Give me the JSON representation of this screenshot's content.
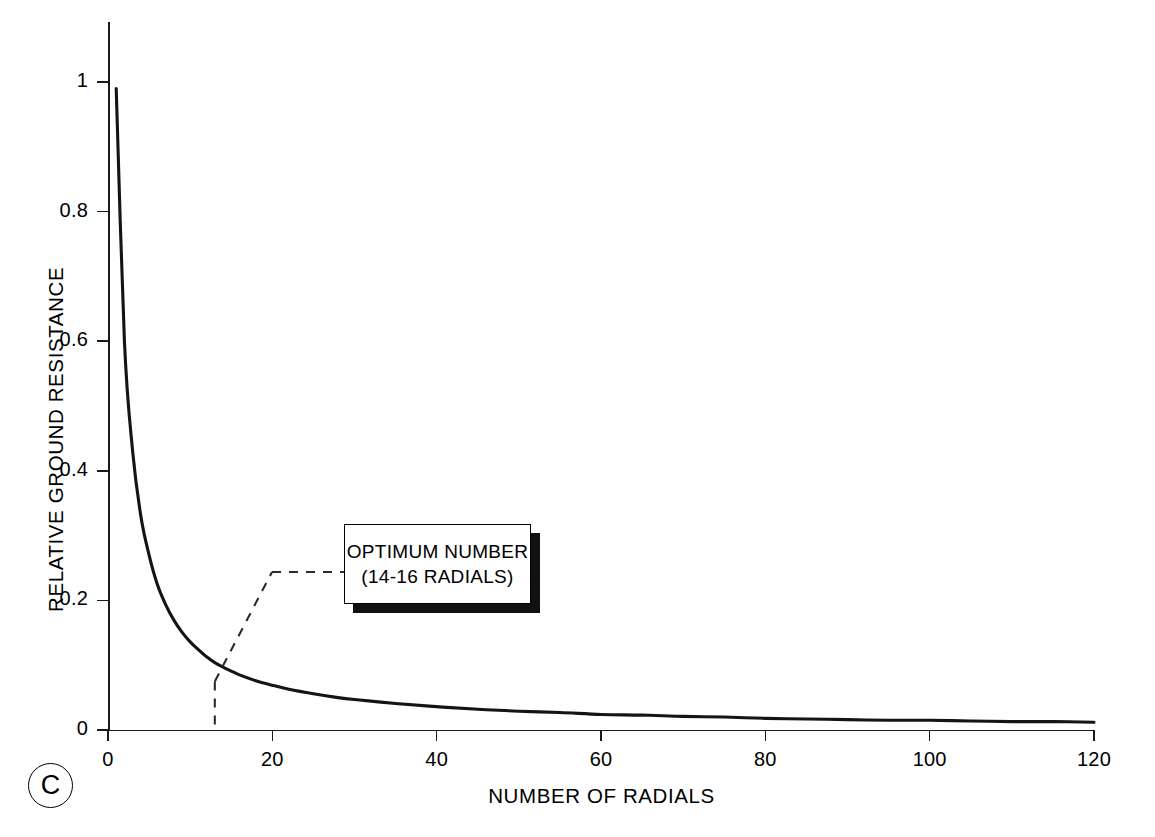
{
  "chart_data": {
    "type": "line",
    "title": "",
    "xlabel": "NUMBER OF RADIALS",
    "ylabel": "RELATIVE GROUND RESISTANCE",
    "xlim": [
      0,
      120
    ],
    "ylim": [
      0,
      1
    ],
    "grid": false,
    "legend": null,
    "x_ticks": [
      0,
      20,
      40,
      60,
      80,
      100,
      120
    ],
    "x_tick_labels": [
      "0",
      "20",
      "40",
      "60",
      "80",
      "100",
      "120"
    ],
    "y_ticks": [
      0,
      0.2,
      0.4,
      0.6,
      0.8,
      1
    ],
    "y_tick_labels": [
      "0",
      "0.2",
      "0.4",
      "0.6",
      "0.8",
      "1"
    ],
    "series": [
      {
        "name": "Relative ground resistance",
        "x": [
          1,
          2,
          3,
          4,
          5,
          6,
          7,
          8,
          9,
          10,
          11,
          12,
          13,
          14,
          15,
          16,
          18,
          20,
          22,
          25,
          28,
          30,
          35,
          40,
          45,
          50,
          55,
          60,
          65,
          70,
          75,
          80,
          85,
          90,
          95,
          100,
          105,
          110,
          115,
          120
        ],
        "y": [
          0.99,
          0.6,
          0.43,
          0.33,
          0.27,
          0.225,
          0.194,
          0.17,
          0.151,
          0.136,
          0.124,
          0.113,
          0.104,
          0.097,
          0.091,
          0.085,
          0.076,
          0.069,
          0.063,
          0.056,
          0.05,
          0.047,
          0.041,
          0.036,
          0.032,
          0.029,
          0.027,
          0.024,
          0.023,
          0.021,
          0.02,
          0.018,
          0.017,
          0.016,
          0.015,
          0.015,
          0.014,
          0.013,
          0.013,
          0.012
        ]
      }
    ],
    "annotations": [
      {
        "type": "callout",
        "lines": [
          "OPTIMUM NUMBER",
          "(14-16 RADIALS)"
        ],
        "points_to_x": 13,
        "points_to_y": 0.075,
        "leader_style": "dashed"
      }
    ]
  },
  "axis": {
    "y_title": "RELATIVE GROUND RESISTANCE",
    "x_title": "NUMBER OF RADIALS",
    "y_tick_labels": [
      "1",
      "0.8",
      "0.6",
      "0.4",
      "0.2",
      "0"
    ],
    "x_tick_labels": [
      "0",
      "20",
      "40",
      "60",
      "80",
      "100",
      "120"
    ]
  },
  "callout": {
    "line1": "OPTIMUM NUMBER",
    "line2": "(14-16 RADIALS)"
  },
  "panel": {
    "label": "C"
  },
  "caption": {
    "text": ""
  },
  "colors": {
    "ink": "#000000",
    "curve": "#141414",
    "background": "#ffffff"
  }
}
